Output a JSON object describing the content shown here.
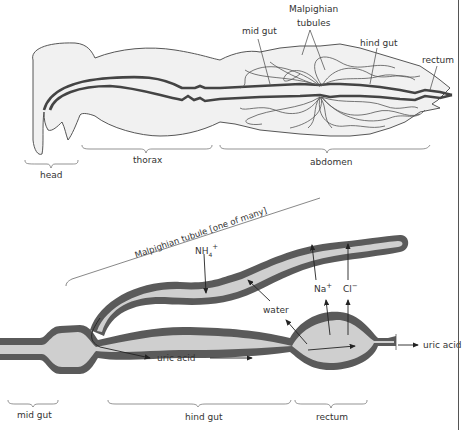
{
  "figure": {
    "top_panel": {
      "title": "Insect body with digestive tract and Malpighian tubules",
      "labels": {
        "malpighian_tubules_line1": "Malpighian",
        "malpighian_tubules_line2": "tubules",
        "mid_gut": "mid gut",
        "hind_gut": "hind gut",
        "rectum": "rectum",
        "head": "head",
        "thorax": "thorax",
        "abdomen": "abdomen"
      }
    },
    "bottom_panel": {
      "title": "Detail of excretion via Malpighian tubule",
      "labels": {
        "malpighian_tubule": "Malpighian tubule [one of many]",
        "nh4": "NH",
        "nh4_sub": "4",
        "nh4_sup": "+",
        "water": "water",
        "na": "Na",
        "na_sup": "+",
        "cl": "Cl",
        "cl_sup": "−",
        "uric_acid_inner": "uric acid",
        "uric_acid_out": "uric acid",
        "mid_gut": "mid gut",
        "hind_gut": "hind gut",
        "rectum": "rectum"
      }
    },
    "colors": {
      "body_fill": "#f1f1f1",
      "gut_wall": "#5a5a5a",
      "lumen_fill": "#cfcfcf",
      "outline": "#333333",
      "text": "#333333"
    }
  }
}
